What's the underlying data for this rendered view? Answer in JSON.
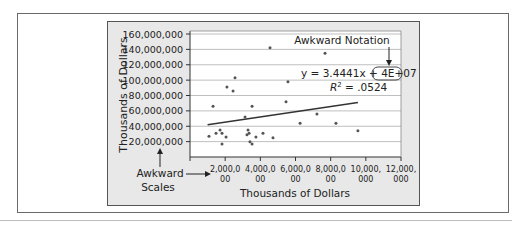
{
  "chart_data": {
    "type": "scatter",
    "title": "",
    "xlabel": "Thousands of Dollars",
    "ylabel": "Thousands of Dollars",
    "xlim": [
      0,
      12000000
    ],
    "ylim": [
      0,
      160000000
    ],
    "grid": "horizontal",
    "x_ticks": [
      {
        "value": 2000000,
        "line1": "2,000,0",
        "line2": "00"
      },
      {
        "value": 4000000,
        "line1": "4,000,0",
        "line2": "00"
      },
      {
        "value": 6000000,
        "line1": "6,000,0",
        "line2": "00"
      },
      {
        "value": 8000000,
        "line1": "8,000,0",
        "line2": "00"
      },
      {
        "value": 10000000,
        "line1": "10,000,",
        "line2": "000"
      },
      {
        "value": 12000000,
        "line1": "12,000,",
        "line2": "000"
      }
    ],
    "y_ticks": [
      {
        "value": 20000000,
        "label": "20,000,000"
      },
      {
        "value": 40000000,
        "label": "40,000,000"
      },
      {
        "value": 60000000,
        "label": "60,000,000"
      },
      {
        "value": 80000000,
        "label": "80,000,000"
      },
      {
        "value": 100000000,
        "label": "100,000,000"
      },
      {
        "value": 120000000,
        "label": "120,000,000"
      },
      {
        "value": 140000000,
        "label": "140,000,000"
      },
      {
        "value": 160000000,
        "label": "160,000,000"
      }
    ],
    "series": [
      {
        "name": "data",
        "points": [
          [
            1080000,
            27000000
          ],
          [
            1310000,
            66000000
          ],
          [
            1480000,
            31000000
          ],
          [
            1710000,
            35000000
          ],
          [
            1820000,
            31000000
          ],
          [
            1820000,
            17000000
          ],
          [
            2050000,
            26000000
          ],
          [
            2100000,
            91000000
          ],
          [
            2450000,
            86000000
          ],
          [
            2560000,
            103000000
          ],
          [
            3130000,
            52000000
          ],
          [
            3240000,
            29000000
          ],
          [
            3360000,
            31000000
          ],
          [
            3300000,
            35000000
          ],
          [
            3410000,
            20000000
          ],
          [
            3530000,
            17000000
          ],
          [
            3530000,
            66000000
          ],
          [
            3750000,
            26000000
          ],
          [
            4150000,
            31000000
          ],
          [
            4550000,
            142000000
          ],
          [
            4720000,
            25000000
          ],
          [
            5460000,
            72000000
          ],
          [
            5570000,
            98000000
          ],
          [
            6260000,
            44000000
          ],
          [
            7220000,
            56000000
          ],
          [
            7680000,
            135000000
          ],
          [
            8300000,
            44000000
          ],
          [
            9550000,
            34000000
          ]
        ]
      }
    ],
    "trendline": {
      "type": "linear",
      "x_start": 1000000,
      "y_start": 42000000,
      "x_end": 9550000,
      "y_end": 71000000,
      "equation_prefix": "y = 3.4441x + ",
      "equation_highlight": "4E+07",
      "r2_label": "R",
      "r2_value": " = .0524"
    },
    "annotations": [
      {
        "text": "Awkward Notation",
        "points_to": "equation constant 4E+07"
      },
      {
        "text_line1": "Awkward",
        "text_line2": "Scales",
        "points_to": "axis tick labels"
      }
    ]
  },
  "colors": {
    "panel_bg": "#e8e8e8",
    "plot_bg": "#ffffff",
    "gridline": "#bfbfbf",
    "axis": "#333333",
    "point": "#555555",
    "trendline": "#333333",
    "text": "#222222"
  }
}
